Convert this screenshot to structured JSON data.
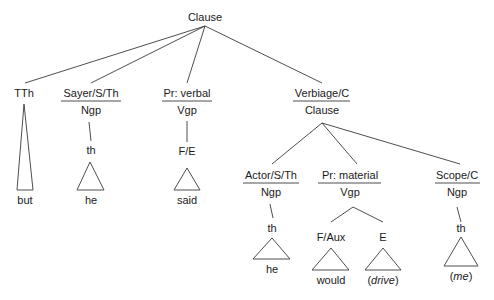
{
  "diagram": {
    "type": "syntax-tree",
    "root": {
      "label": "Clause"
    },
    "nodes": {
      "tth": {
        "function": "TTh",
        "leaf": "but"
      },
      "sayer": {
        "function": "Sayer/S/Th",
        "class": "Ngp",
        "head": "th",
        "leaf": "he"
      },
      "pr_verbal": {
        "function": "Pr: verbal",
        "class": "Vgp",
        "head": "F/E",
        "leaf": "said"
      },
      "verbiage": {
        "function": "Verbiage/C",
        "class": "Clause",
        "children": {
          "actor": {
            "function": "Actor/S/Th",
            "class": "Ngp",
            "head": "th",
            "leaf": "he"
          },
          "pr_material": {
            "function": "Pr: material",
            "class": "Vgp",
            "children": {
              "f_aux": {
                "label": "F/Aux",
                "leaf": "would"
              },
              "e": {
                "label": "E",
                "leaf_open": "(",
                "leaf_word": "drive",
                "leaf_close": ")"
              }
            }
          },
          "scope": {
            "function": "Scope/C",
            "class": "Ngp",
            "head": "th",
            "leaf_open": "(",
            "leaf_word": "me",
            "leaf_close": ")"
          }
        }
      }
    },
    "colors": {
      "line": "#3a3a3a",
      "text": "#1a1a1a",
      "background": "#ffffff"
    }
  }
}
